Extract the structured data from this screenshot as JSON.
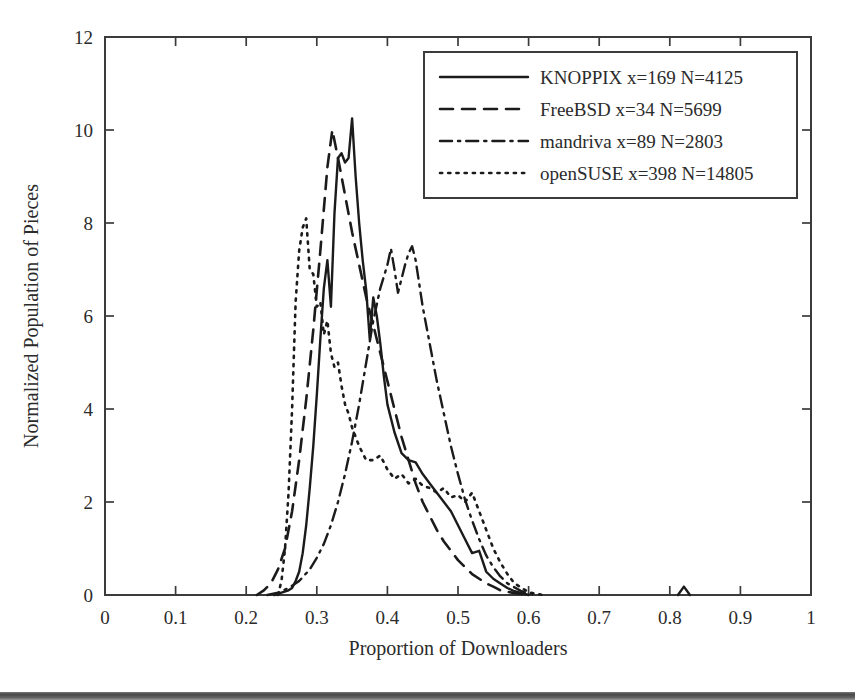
{
  "figure": {
    "background_color": "#ffffff",
    "ink_color": "#1b1b1b"
  },
  "chart_data": {
    "type": "line",
    "title": "",
    "xlabel": "Proportion of Downloaders",
    "ylabel": "Normalized Population of Pieces",
    "xlim": [
      0,
      1
    ],
    "ylim": [
      0,
      12
    ],
    "xticks": [
      "0",
      "0.1",
      "0.2",
      "0.3",
      "0.4",
      "0.5",
      "0.6",
      "0.7",
      "0.8",
      "0.9",
      "1"
    ],
    "xtick_values": [
      0,
      0.1,
      0.2,
      0.3,
      0.4,
      0.5,
      0.6,
      0.7,
      0.8,
      0.9,
      1
    ],
    "yticks": [
      "0",
      "2",
      "4",
      "6",
      "8",
      "10",
      "12"
    ],
    "ytick_values": [
      0,
      2,
      4,
      6,
      8,
      10,
      12
    ],
    "grid": false,
    "legend_position": "top-right",
    "legend_entries": [
      "KNOPPIX x=169 N=4125",
      "FreeBSD x=34 N=5699",
      "mandriva x=89 N=2803",
      "openSUSE x=398 N=14805"
    ],
    "series": [
      {
        "name": "KNOPPIX x=169 N=4125",
        "short_name": "KNOPPIX",
        "x_param": 169,
        "n_param": 4125,
        "dash": "solid",
        "x": [
          0.24,
          0.25,
          0.26,
          0.265,
          0.27,
          0.275,
          0.28,
          0.285,
          0.29,
          0.295,
          0.3,
          0.305,
          0.31,
          0.315,
          0.32,
          0.325,
          0.33,
          0.335,
          0.34,
          0.345,
          0.35,
          0.355,
          0.36,
          0.365,
          0.37,
          0.375,
          0.38,
          0.385,
          0.39,
          0.395,
          0.4,
          0.41,
          0.42,
          0.43,
          0.44,
          0.45,
          0.46,
          0.47,
          0.48,
          0.49,
          0.5,
          0.51,
          0.52,
          0.53,
          0.54,
          0.55,
          0.56,
          0.57,
          0.58,
          0.6
        ],
        "y": [
          0.0,
          0.05,
          0.1,
          0.15,
          0.3,
          0.5,
          0.9,
          1.5,
          2.3,
          3.2,
          4.3,
          5.5,
          6.6,
          7.2,
          6.2,
          8.2,
          9.4,
          9.5,
          9.3,
          9.4,
          10.25,
          9.0,
          8.0,
          7.2,
          6.55,
          5.5,
          6.4,
          6.0,
          5.4,
          4.7,
          4.1,
          3.5,
          3.05,
          2.9,
          2.85,
          2.6,
          2.4,
          2.2,
          2.0,
          1.8,
          1.5,
          1.2,
          0.9,
          0.95,
          0.5,
          0.35,
          0.25,
          0.15,
          0.08,
          0.0
        ]
      },
      {
        "name": "FreeBSD x=34 N=5699",
        "short_name": "FreeBSD",
        "x_param": 34,
        "n_param": 5699,
        "dash": "dashed",
        "x": [
          0.215,
          0.225,
          0.235,
          0.245,
          0.255,
          0.265,
          0.275,
          0.285,
          0.295,
          0.305,
          0.315,
          0.322,
          0.33,
          0.34,
          0.35,
          0.36,
          0.37,
          0.38,
          0.39,
          0.4,
          0.41,
          0.42,
          0.43,
          0.44,
          0.45,
          0.46,
          0.47,
          0.48,
          0.49,
          0.5,
          0.51,
          0.52,
          0.53,
          0.54,
          0.55,
          0.56,
          0.58,
          0.6
        ],
        "y": [
          0.0,
          0.1,
          0.25,
          0.55,
          1.0,
          1.8,
          2.9,
          4.2,
          5.7,
          7.4,
          9.2,
          10.0,
          9.4,
          8.6,
          7.8,
          7.1,
          6.4,
          5.8,
          5.2,
          4.6,
          4.0,
          3.4,
          2.9,
          2.4,
          2.0,
          1.7,
          1.4,
          1.15,
          0.95,
          0.75,
          0.6,
          0.45,
          0.35,
          0.25,
          0.18,
          0.1,
          0.04,
          0.0
        ]
      },
      {
        "name": "mandriva x=89 N=2803",
        "short_name": "mandriva",
        "x_param": 89,
        "n_param": 2803,
        "dash": "dashdot",
        "x": [
          0.23,
          0.245,
          0.26,
          0.275,
          0.29,
          0.3,
          0.31,
          0.32,
          0.33,
          0.34,
          0.35,
          0.36,
          0.37,
          0.38,
          0.39,
          0.4,
          0.405,
          0.41,
          0.415,
          0.42,
          0.425,
          0.43,
          0.435,
          0.44,
          0.445,
          0.45,
          0.46,
          0.47,
          0.48,
          0.49,
          0.5,
          0.51,
          0.52,
          0.53,
          0.54,
          0.55,
          0.56,
          0.57,
          0.59,
          0.61
        ],
        "y": [
          0.0,
          0.05,
          0.15,
          0.3,
          0.55,
          0.8,
          1.1,
          1.5,
          2.0,
          2.6,
          3.3,
          4.1,
          5.0,
          5.9,
          6.6,
          7.1,
          7.45,
          7.0,
          6.5,
          6.8,
          7.1,
          7.35,
          7.5,
          7.2,
          6.7,
          6.2,
          5.4,
          4.6,
          3.9,
          3.2,
          2.6,
          2.05,
          1.6,
          1.2,
          0.85,
          0.6,
          0.4,
          0.25,
          0.08,
          0.0
        ]
      },
      {
        "name": "openSUSE x=398 N=14805",
        "short_name": "openSUSE",
        "x_param": 398,
        "n_param": 14805,
        "dash": "dotted",
        "x": [
          0.245,
          0.25,
          0.255,
          0.26,
          0.265,
          0.27,
          0.275,
          0.28,
          0.285,
          0.29,
          0.295,
          0.3,
          0.305,
          0.31,
          0.315,
          0.32,
          0.325,
          0.33,
          0.335,
          0.34,
          0.345,
          0.35,
          0.36,
          0.37,
          0.38,
          0.39,
          0.4,
          0.41,
          0.42,
          0.43,
          0.44,
          0.45,
          0.46,
          0.47,
          0.48,
          0.49,
          0.5,
          0.51,
          0.52,
          0.53,
          0.54,
          0.55,
          0.56,
          0.57,
          0.58,
          0.6,
          0.62
        ],
        "y": [
          0.0,
          0.3,
          1.0,
          2.2,
          4.0,
          6.3,
          7.4,
          7.9,
          8.1,
          7.0,
          6.9,
          6.2,
          6.3,
          5.6,
          5.9,
          5.2,
          4.9,
          5.0,
          4.5,
          4.1,
          3.9,
          3.6,
          3.2,
          2.9,
          2.9,
          3.0,
          2.7,
          2.5,
          2.6,
          2.4,
          2.5,
          2.35,
          2.3,
          2.2,
          2.3,
          2.1,
          2.15,
          2.0,
          2.2,
          1.8,
          1.4,
          1.0,
          0.7,
          0.45,
          0.25,
          0.06,
          0.0
        ]
      }
    ],
    "annotations": [
      {
        "label": "small isolated spike",
        "x": 0.82,
        "y": 0.18
      }
    ]
  }
}
